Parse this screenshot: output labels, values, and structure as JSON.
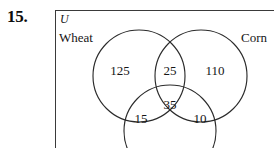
{
  "problem": {
    "number": "15."
  },
  "diagram": {
    "type": "venn-three-set",
    "universe_label": "U",
    "sets": [
      {
        "id": "wheat",
        "label": "Wheat"
      },
      {
        "id": "corn",
        "label": "Corn"
      },
      {
        "id": "third",
        "label": ""
      }
    ],
    "regions": [
      {
        "id": "wheat-only",
        "label": "125",
        "value": 125
      },
      {
        "id": "wheat-corn",
        "label": "25",
        "value": 25
      },
      {
        "id": "corn-only",
        "label": "110",
        "value": 110
      },
      {
        "id": "all-three",
        "label": "35",
        "value": 35
      },
      {
        "id": "wheat-third",
        "label": "15",
        "value": 15
      },
      {
        "id": "corn-third",
        "label": "10",
        "value": 10
      }
    ],
    "geometry": {
      "circles": [
        {
          "id": "wheat",
          "cx": 139,
          "cy": 76,
          "r": 46
        },
        {
          "id": "corn",
          "cx": 201,
          "cy": 76,
          "r": 46
        },
        {
          "id": "third",
          "cx": 170,
          "cy": 131,
          "r": 46
        }
      ]
    },
    "colors": {
      "stroke": "#2b2b2b",
      "frame": "#3a3a3a",
      "text": "#161616",
      "background": "#ffffff"
    }
  }
}
